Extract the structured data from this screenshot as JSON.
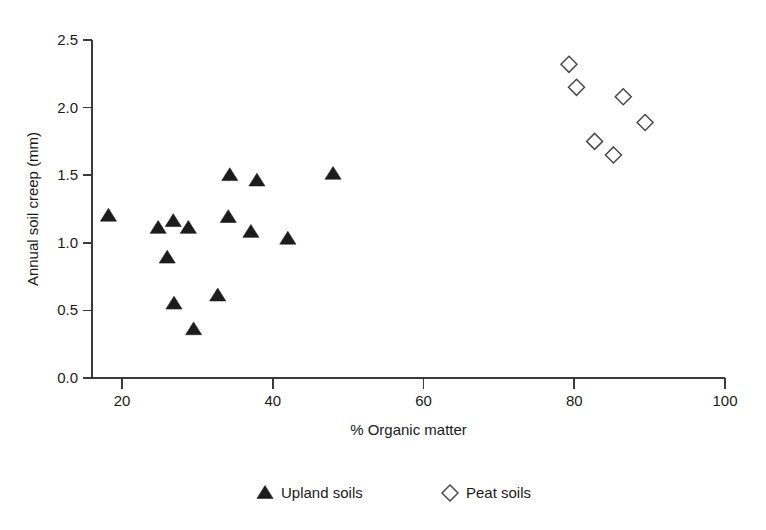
{
  "chart_data": {
    "type": "scatter",
    "title": "",
    "xlabel": "% Organic matter",
    "ylabel": "Annual soil creep (mm)",
    "xlim": [
      15,
      100
    ],
    "ylim": [
      0.0,
      2.5
    ],
    "xticks": [
      "20",
      "40",
      "60",
      "80",
      "100"
    ],
    "xtick_values": [
      20,
      40,
      60,
      80,
      100
    ],
    "yticks": [
      "0.0",
      "0.5",
      "1.0",
      "1.5",
      "2.0",
      "2.5"
    ],
    "ytick_values": [
      0.0,
      0.5,
      1.0,
      1.5,
      2.0,
      2.5
    ],
    "grid": false,
    "legend_position": "below-center",
    "series": [
      {
        "name": "Upland soils",
        "marker": "filled-triangle",
        "color": "#1c1c1c",
        "points": [
          {
            "x": 18.2,
            "y": 1.2
          },
          {
            "x": 24.8,
            "y": 1.11
          },
          {
            "x": 26.8,
            "y": 1.16
          },
          {
            "x": 28.8,
            "y": 1.11
          },
          {
            "x": 26.0,
            "y": 0.89
          },
          {
            "x": 26.9,
            "y": 0.55
          },
          {
            "x": 29.5,
            "y": 0.36
          },
          {
            "x": 32.7,
            "y": 0.61
          },
          {
            "x": 34.3,
            "y": 1.5
          },
          {
            "x": 34.1,
            "y": 1.19
          },
          {
            "x": 37.1,
            "y": 1.08
          },
          {
            "x": 37.9,
            "y": 1.46
          },
          {
            "x": 42.0,
            "y": 1.03
          },
          {
            "x": 48.0,
            "y": 1.51
          }
        ]
      },
      {
        "name": "Peat soils",
        "marker": "open-diamond",
        "color": "#4a4a4a",
        "points": [
          {
            "x": 79.3,
            "y": 2.32
          },
          {
            "x": 80.3,
            "y": 2.15
          },
          {
            "x": 86.5,
            "y": 2.08
          },
          {
            "x": 89.4,
            "y": 1.89
          },
          {
            "x": 82.7,
            "y": 1.75
          },
          {
            "x": 85.2,
            "y": 1.65
          }
        ]
      }
    ]
  },
  "legend": {
    "items": [
      {
        "label": "Upland soils",
        "marker": "filled-triangle"
      },
      {
        "label": "Peat soils",
        "marker": "open-diamond"
      }
    ]
  }
}
